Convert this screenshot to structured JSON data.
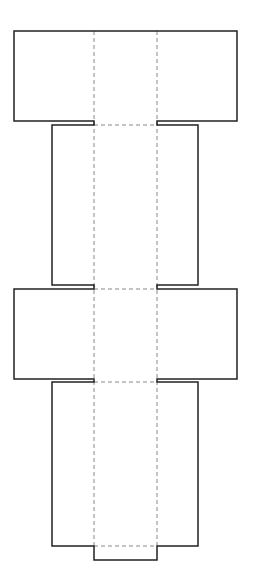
{
  "diagram": {
    "type": "box-net",
    "canvas": {
      "width": 253,
      "height": 586,
      "background": "#ffffff"
    },
    "colors": {
      "cut_line": "#222222",
      "fold_line": "#888888"
    },
    "outline_points": "14,31 237,31 237,121 157,121 157,125 198,125 198,285 157,285 157,289 237,289 237,379 157,379 157,382 198,382 198,546 157,546 157,560 94,560 94,546 52,546 52,382 94,382 94,379 14,379 14,289 94,289 94,285 52,285 52,125 94,125 94,121 14,121",
    "fold_lines": [
      {
        "x1": 94,
        "y1": 31,
        "x2": 94,
        "y2": 546
      },
      {
        "x1": 157,
        "y1": 31,
        "x2": 157,
        "y2": 546
      },
      {
        "x1": 94,
        "y1": 125,
        "x2": 157,
        "y2": 125
      },
      {
        "x1": 94,
        "y1": 289,
        "x2": 157,
        "y2": 289
      },
      {
        "x1": 94,
        "y1": 382,
        "x2": 157,
        "y2": 382
      },
      {
        "x1": 94,
        "y1": 546,
        "x2": 157,
        "y2": 546
      }
    ]
  }
}
